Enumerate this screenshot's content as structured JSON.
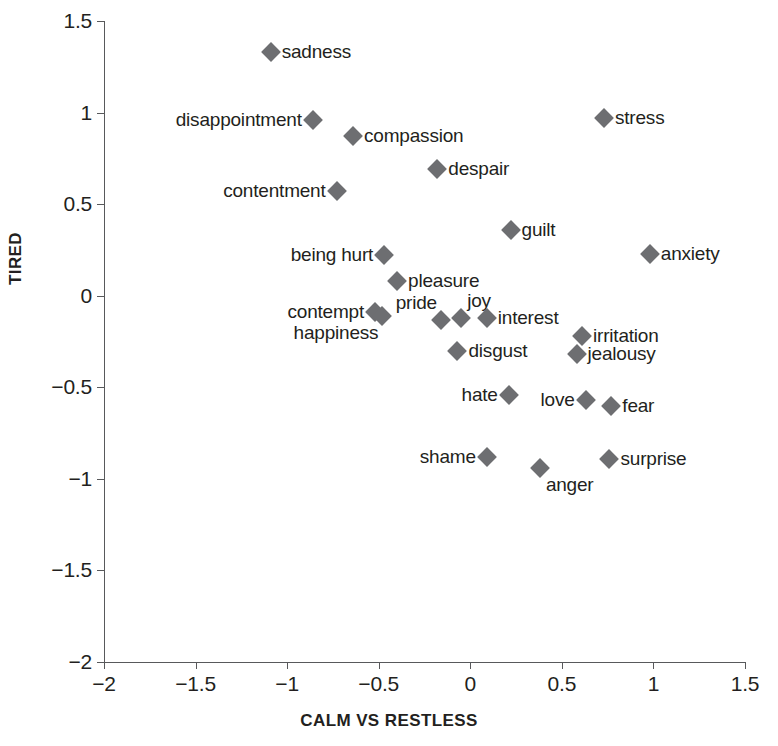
{
  "chart_data": {
    "type": "scatter",
    "title": "",
    "xlabel": "CALM VS RESTLESS",
    "ylabel": "TIRED",
    "xlim": [
      -2,
      1.5
    ],
    "ylim": [
      -2,
      1.5
    ],
    "xticks": [
      -2,
      -1.5,
      -1,
      -0.5,
      0,
      0.5,
      1,
      1.5
    ],
    "yticks": [
      1.5,
      1,
      0.5,
      0,
      -0.5,
      -1,
      -1.5,
      -2
    ],
    "xtick_labels": [
      "−2",
      "−1.5",
      "−1",
      "−0.5",
      "0",
      "0.5",
      "1",
      "1.5"
    ],
    "ytick_labels": [
      "1.5",
      "1",
      "0.5",
      "0",
      "−0.5",
      "−1",
      "−1.5",
      "−2"
    ],
    "grid": false,
    "legend": "none",
    "marker": "diamond",
    "marker_color": "#6d6e71",
    "points": [
      {
        "label": "sadness",
        "x": -1.09,
        "y": 1.33,
        "label_pos": "right"
      },
      {
        "label": "disappointment",
        "x": -0.86,
        "y": 0.96,
        "label_pos": "left"
      },
      {
        "label": "compassion",
        "x": -0.64,
        "y": 0.87,
        "label_pos": "right"
      },
      {
        "label": "stress",
        "x": 0.73,
        "y": 0.97,
        "label_pos": "right"
      },
      {
        "label": "despair",
        "x": -0.18,
        "y": 0.69,
        "label_pos": "right"
      },
      {
        "label": "contentment",
        "x": -0.73,
        "y": 0.57,
        "label_pos": "left"
      },
      {
        "label": "guilt",
        "x": 0.22,
        "y": 0.36,
        "label_pos": "right"
      },
      {
        "label": "anxiety",
        "x": 0.98,
        "y": 0.23,
        "label_pos": "right"
      },
      {
        "label": "being hurt",
        "x": -0.47,
        "y": 0.22,
        "label_pos": "left"
      },
      {
        "label": "pleasure",
        "x": -0.4,
        "y": 0.08,
        "label_pos": "right"
      },
      {
        "label": "contempt",
        "x": -0.52,
        "y": -0.09,
        "label_pos": "left"
      },
      {
        "label": "happiness",
        "x": -0.48,
        "y": -0.11,
        "label_pos": "below-left"
      },
      {
        "label": "pride",
        "x": -0.16,
        "y": -0.13,
        "label_pos": "above-left"
      },
      {
        "label": "joy",
        "x": -0.05,
        "y": -0.12,
        "label_pos": "above-right"
      },
      {
        "label": "interest",
        "x": 0.09,
        "y": -0.12,
        "label_pos": "right"
      },
      {
        "label": "irritation",
        "x": 0.61,
        "y": -0.22,
        "label_pos": "right"
      },
      {
        "label": "disgust",
        "x": -0.07,
        "y": -0.3,
        "label_pos": "right"
      },
      {
        "label": "jealousy",
        "x": 0.58,
        "y": -0.32,
        "label_pos": "right"
      },
      {
        "label": "hate",
        "x": 0.21,
        "y": -0.54,
        "label_pos": "left"
      },
      {
        "label": "love",
        "x": 0.63,
        "y": -0.57,
        "label_pos": "left"
      },
      {
        "label": "fear",
        "x": 0.77,
        "y": -0.6,
        "label_pos": "right"
      },
      {
        "label": "shame",
        "x": 0.09,
        "y": -0.88,
        "label_pos": "left"
      },
      {
        "label": "anger",
        "x": 0.38,
        "y": -0.94,
        "label_pos": "below-right"
      },
      {
        "label": "surprise",
        "x": 0.76,
        "y": -0.89,
        "label_pos": "right"
      }
    ]
  },
  "axes": {
    "x_title": "CALM VS RESTLESS",
    "y_title": "TIRED"
  },
  "caption": {
    "partial_line": ""
  }
}
